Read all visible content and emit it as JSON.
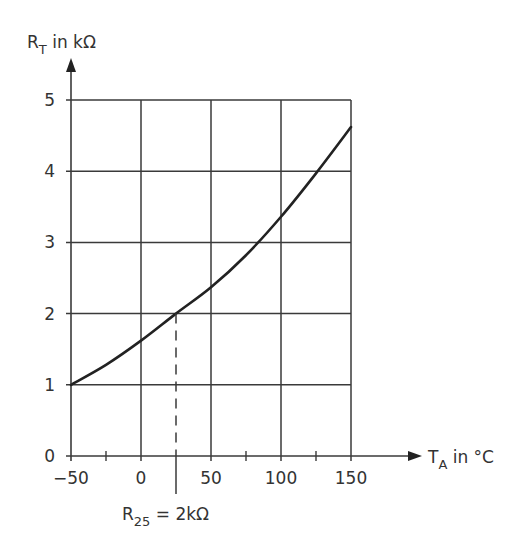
{
  "chart_data": {
    "type": "line",
    "title": "",
    "xlabel": "T_A in °C",
    "ylabel": "R_T in kΩ",
    "xlim": [
      -50,
      150
    ],
    "ylim": [
      0,
      5
    ],
    "grid": true,
    "legend": null,
    "x_ticks": [
      -50,
      0,
      50,
      100,
      150
    ],
    "x_tick_labels": [
      "−50",
      "0",
      "50",
      "100",
      "150"
    ],
    "x_minor_ticks": [
      -25,
      75,
      125
    ],
    "y_ticks": [
      0,
      1,
      2,
      3,
      4,
      5
    ],
    "y_tick_labels": [
      "0",
      "1",
      "2",
      "3",
      "4",
      "5"
    ],
    "series": [
      {
        "name": "R_T",
        "x": [
          -50,
          -25,
          0,
          25,
          50,
          75,
          100,
          125,
          150
        ],
        "values": [
          1.0,
          1.28,
          1.62,
          2.0,
          2.37,
          2.82,
          3.36,
          3.97,
          4.62
        ]
      }
    ],
    "annotations": [
      {
        "type": "vline-dashed",
        "x": 25,
        "y_to": 2.0,
        "label": "R25 = 2kΩ"
      }
    ]
  },
  "labels": {
    "y_axis_main": "R",
    "y_axis_sub": "T",
    "y_axis_rest": " in kΩ",
    "x_axis_main": "T",
    "x_axis_sub": "A",
    "x_axis_rest": " in °C",
    "ann_main": "R",
    "ann_sub": "25",
    "ann_rest": " = 2kΩ"
  },
  "colors": {
    "ink": "#333333",
    "grid": "#3a3a3a",
    "curve": "#222222",
    "background": "#ffffff"
  }
}
